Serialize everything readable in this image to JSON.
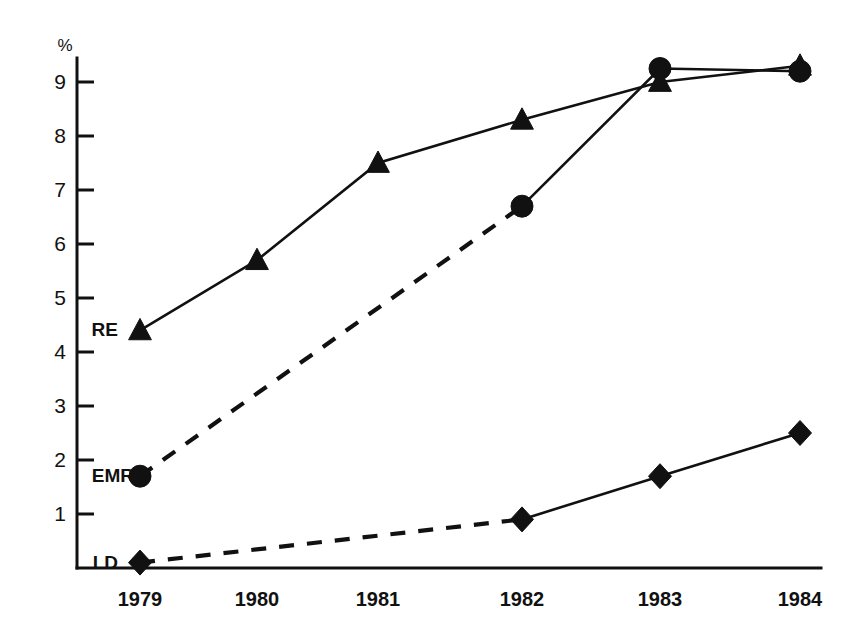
{
  "chart_data": {
    "type": "line",
    "title": "",
    "xlabel": "",
    "ylabel": "%",
    "y_unit_label": "%",
    "categories": [
      "1979",
      "1980",
      "1981",
      "1982",
      "1983",
      "1984"
    ],
    "x": [
      1979,
      1980,
      1981,
      1982,
      1983,
      1984
    ],
    "xlim": [
      1978.55,
      1984.4
    ],
    "ylim": [
      0,
      9.55
    ],
    "yticks": [
      1,
      2,
      3,
      4,
      5,
      6,
      7,
      8,
      9
    ],
    "ytick_labels": [
      "1",
      "2",
      "3",
      "4",
      "5",
      "6",
      "7",
      "8",
      "9"
    ],
    "grid": false,
    "legend": "inline-left-labels",
    "colors": {
      "ink": "#111111",
      "background": "#ffffff"
    },
    "series": [
      {
        "name": "RE",
        "label": "RE",
        "marker": "triangle",
        "linestyle": "solid",
        "label_value_y": 4.4,
        "values": [
          4.4,
          5.7,
          7.5,
          8.3,
          9.0,
          9.3
        ],
        "points": [
          {
            "x": "1979",
            "y": 4.4
          },
          {
            "x": "1980",
            "y": 5.7
          },
          {
            "x": "1981",
            "y": 7.5
          },
          {
            "x": "1982",
            "y": 8.3
          },
          {
            "x": "1983",
            "y": 9.0
          },
          {
            "x": "1984",
            "y": 9.3
          }
        ]
      },
      {
        "name": "EMR",
        "label": "EMR",
        "marker": "circle",
        "linestyle": "dashed-then-solid",
        "dashed_segment": [
          "1979",
          "1982"
        ],
        "solid_segment": [
          "1982",
          "1984"
        ],
        "label_value_y": 1.7,
        "values": [
          1.7,
          null,
          null,
          6.7,
          9.25,
          9.2
        ],
        "points": [
          {
            "x": "1979",
            "y": 1.7
          },
          {
            "x": "1982",
            "y": 6.7
          },
          {
            "x": "1983",
            "y": 9.25
          },
          {
            "x": "1984",
            "y": 9.2
          }
        ]
      },
      {
        "name": "LD",
        "label": "LD",
        "marker": "diamond",
        "linestyle": "dashed-then-solid",
        "dashed_segment": [
          "1979",
          "1982"
        ],
        "solid_segment": [
          "1982",
          "1984"
        ],
        "label_value_y": 0.1,
        "values": [
          0.1,
          null,
          null,
          0.9,
          1.7,
          2.5
        ],
        "points": [
          {
            "x": "1979",
            "y": 0.1
          },
          {
            "x": "1982",
            "y": 0.9
          },
          {
            "x": "1983",
            "y": 1.7
          },
          {
            "x": "1984",
            "y": 2.5
          }
        ]
      }
    ]
  }
}
